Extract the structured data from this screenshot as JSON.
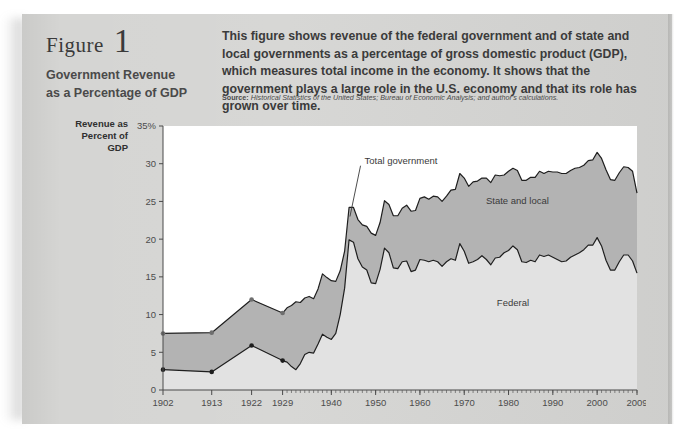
{
  "figure": {
    "label": "Figure",
    "number": "1",
    "title": "Government Revenue\nas a Percentage of GDP",
    "title_line1": "Government Revenue",
    "title_line2": "as a Percentage of GDP",
    "blurb": "This figure shows revenue of the federal government and of state and local governments as a percentage of gross domestic product (GDP), which measures total income in the economy. It shows that the government plays a large role in the U.S. economy and that its role has grown over time.",
    "source_label": "Source:",
    "source_text": "Historical Statistics of the United States; Bureau of Economic Analysis; and author's calculations."
  },
  "colors": {
    "page": "#d5d5d3",
    "plot_bg": "#ffffff",
    "federal_fill": "#e2e2e2",
    "state_local_fill": "#b3b3b3",
    "line": "#1e1e1e",
    "tick_text": "#4c4c4c"
  },
  "chart_data": {
    "type": "area",
    "title": "Government Revenue as a Percentage of GDP",
    "xlabel": "",
    "ylabel": "Revenue as Percent of GDP",
    "ylabel_lines": [
      "Revenue as",
      "Percent of",
      "GDP"
    ],
    "ylim": [
      0,
      35
    ],
    "yticks": [
      0,
      5,
      10,
      15,
      20,
      25,
      30,
      35
    ],
    "ytick_labels": [
      "0",
      "5",
      "10",
      "15",
      "20",
      "25",
      "30",
      "35%"
    ],
    "xlim": [
      1902,
      2009
    ],
    "xticks": [
      1902,
      1913,
      1922,
      1929,
      1940,
      1950,
      1960,
      1970,
      1980,
      1990,
      2000,
      2009
    ],
    "xtick_labels": [
      "1902",
      "1913",
      "1922",
      "1929",
      "1940",
      "1950",
      "1960",
      "1970",
      "1980",
      "1990",
      "2000",
      "2009"
    ],
    "grid": false,
    "legend_position": "inline-annotations",
    "stacked": true,
    "annotations": [
      {
        "name": "total-government",
        "text": "Total government",
        "x": 1947.5,
        "y": 30.0
      },
      {
        "name": "state-and-local",
        "text": "State and local",
        "x": 1982,
        "y": 24.6
      },
      {
        "name": "federal",
        "text": "Federal",
        "x": 1981,
        "y": 11.2
      }
    ],
    "markers_years": [
      1902,
      1913,
      1922,
      1929
    ],
    "series": [
      {
        "name": "Federal",
        "fill": "#e2e2e2",
        "x": [
          1902,
          1913,
          1922,
          1929,
          1930,
          1931,
          1932,
          1933,
          1934,
          1935,
          1936,
          1937,
          1938,
          1939,
          1940,
          1941,
          1942,
          1943,
          1944,
          1945,
          1946,
          1947,
          1948,
          1949,
          1950,
          1951,
          1952,
          1953,
          1954,
          1955,
          1956,
          1957,
          1958,
          1959,
          1960,
          1961,
          1962,
          1963,
          1964,
          1965,
          1966,
          1967,
          1968,
          1969,
          1970,
          1971,
          1972,
          1973,
          1974,
          1975,
          1976,
          1977,
          1978,
          1979,
          1980,
          1981,
          1982,
          1983,
          1984,
          1985,
          1986,
          1987,
          1988,
          1989,
          1990,
          1991,
          1992,
          1993,
          1994,
          1995,
          1996,
          1997,
          1998,
          1999,
          2000,
          2001,
          2002,
          2003,
          2004,
          2005,
          2006,
          2007,
          2008,
          2009
        ],
        "values": [
          2.7,
          2.4,
          5.9,
          3.9,
          3.7,
          3.1,
          2.7,
          3.5,
          4.7,
          5.0,
          4.9,
          6.1,
          7.4,
          7.0,
          6.7,
          7.5,
          10.0,
          13.5,
          19.9,
          19.6,
          17.4,
          16.3,
          15.9,
          14.2,
          14.1,
          16.0,
          18.8,
          18.2,
          16.2,
          16.1,
          17.0,
          17.1,
          15.7,
          15.9,
          17.3,
          17.2,
          17.0,
          17.2,
          17.0,
          16.4,
          17.0,
          17.4,
          17.2,
          19.4,
          18.4,
          16.8,
          17.0,
          17.3,
          17.8,
          17.3,
          16.6,
          17.5,
          17.6,
          18.2,
          18.5,
          19.1,
          18.6,
          17.0,
          16.9,
          17.2,
          17.0,
          17.9,
          17.7,
          17.9,
          17.6,
          17.3,
          17.0,
          17.1,
          17.6,
          17.9,
          18.2,
          18.6,
          19.2,
          19.2,
          20.2,
          19.1,
          17.2,
          15.9,
          15.9,
          17.0,
          17.9,
          17.9,
          17.1,
          15.5
        ]
      },
      {
        "name": "State and local",
        "fill": "#b3b3b3",
        "x": [
          1902,
          1913,
          1922,
          1929,
          1930,
          1931,
          1932,
          1933,
          1934,
          1935,
          1936,
          1937,
          1938,
          1939,
          1940,
          1941,
          1942,
          1943,
          1944,
          1945,
          1946,
          1947,
          1948,
          1949,
          1950,
          1951,
          1952,
          1953,
          1954,
          1955,
          1956,
          1957,
          1958,
          1959,
          1960,
          1961,
          1962,
          1963,
          1964,
          1965,
          1966,
          1967,
          1968,
          1969,
          1970,
          1971,
          1972,
          1973,
          1974,
          1975,
          1976,
          1977,
          1978,
          1979,
          1980,
          1981,
          1982,
          1983,
          1984,
          1985,
          1986,
          1987,
          1988,
          1989,
          1990,
          1991,
          1992,
          1993,
          1994,
          1995,
          1996,
          1997,
          1998,
          1999,
          2000,
          2001,
          2002,
          2003,
          2004,
          2005,
          2006,
          2007,
          2008,
          2009
        ],
        "values": [
          4.8,
          5.2,
          6.1,
          6.3,
          7.2,
          8.1,
          9.0,
          8.1,
          7.5,
          7.4,
          7.2,
          7.3,
          8.0,
          7.9,
          7.8,
          6.9,
          5.8,
          4.9,
          4.3,
          4.6,
          5.2,
          5.6,
          5.8,
          6.6,
          6.4,
          6.2,
          6.3,
          6.4,
          6.9,
          7.0,
          7.1,
          7.4,
          8.0,
          7.9,
          8.1,
          8.4,
          8.3,
          8.5,
          8.6,
          8.6,
          8.7,
          9.1,
          9.4,
          9.3,
          9.7,
          10.2,
          10.6,
          10.4,
          10.3,
          10.8,
          10.9,
          11.0,
          10.8,
          10.3,
          10.5,
          10.3,
          10.5,
          10.8,
          10.9,
          11.0,
          11.2,
          11.1,
          11.0,
          11.1,
          11.3,
          11.6,
          11.7,
          11.6,
          11.5,
          11.5,
          11.3,
          11.2,
          11.2,
          11.3,
          11.3,
          11.6,
          12.0,
          12.0,
          11.9,
          11.8,
          11.7,
          11.6,
          11.9,
          10.6
        ]
      }
    ]
  }
}
